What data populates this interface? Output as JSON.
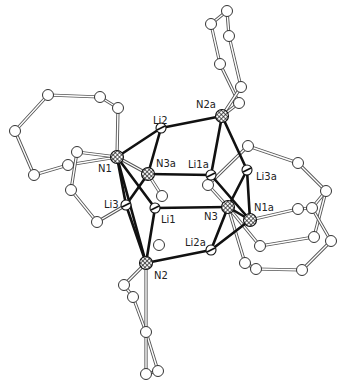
{
  "figure": {
    "type": "ORTEP-style molecular structure",
    "background": "#ffffff",
    "bond_color": "#111111",
    "ring_bond_color": "#555555"
  },
  "atoms": [
    {
      "id": "N1",
      "label": "N1",
      "kind": "N",
      "x": 117,
      "y": 157,
      "lx": 98,
      "ly": 172
    },
    {
      "id": "N2",
      "label": "N2",
      "kind": "N",
      "x": 146,
      "y": 263,
      "lx": 154,
      "ly": 279
    },
    {
      "id": "N3",
      "label": "N3",
      "kind": "N",
      "x": 228,
      "y": 207,
      "lx": 204,
      "ly": 220
    },
    {
      "id": "N1a",
      "label": "N1a",
      "kind": "N",
      "x": 250,
      "y": 220,
      "lx": 254,
      "ly": 211
    },
    {
      "id": "N2a",
      "label": "N2a",
      "kind": "N",
      "x": 222,
      "y": 116,
      "lx": 196,
      "ly": 108
    },
    {
      "id": "N3a",
      "label": "N3a",
      "kind": "N",
      "x": 148,
      "y": 174,
      "lx": 156,
      "ly": 167
    },
    {
      "id": "Li1",
      "label": "Li1",
      "kind": "Li",
      "x": 155,
      "y": 208,
      "lx": 161,
      "ly": 223
    },
    {
      "id": "Li2",
      "label": "Li2",
      "kind": "Li",
      "x": 161,
      "y": 128,
      "lx": 153,
      "ly": 124
    },
    {
      "id": "Li3",
      "label": "Li3",
      "kind": "Li",
      "x": 126,
      "y": 205,
      "lx": 104,
      "ly": 208
    },
    {
      "id": "Li1a",
      "label": "Li1a",
      "kind": "Li",
      "x": 211,
      "y": 175,
      "lx": 188,
      "ly": 168
    },
    {
      "id": "Li2a",
      "label": "Li2a",
      "kind": "Li",
      "x": 211,
      "y": 250,
      "lx": 185,
      "ly": 246
    },
    {
      "id": "Li3a",
      "label": "Li3a",
      "kind": "Li",
      "x": 247,
      "y": 170,
      "lx": 256,
      "ly": 180
    }
  ],
  "core_bonds": [
    [
      "N1",
      "Li2"
    ],
    [
      "N1",
      "Li3"
    ],
    [
      "N1",
      "Li1"
    ],
    [
      "N1",
      "N2"
    ],
    [
      "Li2",
      "N2a"
    ],
    [
      "Li2",
      "N3a"
    ],
    [
      "N3a",
      "Li1a"
    ],
    [
      "N3a",
      "Li3"
    ],
    [
      "Li1",
      "N3"
    ],
    [
      "Li1",
      "N2"
    ],
    [
      "Li3",
      "N2"
    ],
    [
      "N2",
      "Li2a"
    ],
    [
      "Li2a",
      "N3"
    ],
    [
      "Li2a",
      "N1a"
    ],
    [
      "N2a",
      "Li1a"
    ],
    [
      "N2a",
      "Li3a"
    ],
    [
      "Li1a",
      "N1a"
    ],
    [
      "N3",
      "Li3a"
    ],
    [
      "Li3a",
      "N1a"
    ],
    [
      "N3",
      "N1a"
    ]
  ],
  "carbons": [
    {
      "id": "c1",
      "x": 48,
      "y": 95
    },
    {
      "id": "c2",
      "x": 100,
      "y": 97
    },
    {
      "id": "c3",
      "x": 118,
      "y": 108
    },
    {
      "id": "c4",
      "x": 15,
      "y": 131
    },
    {
      "id": "c5",
      "x": 34,
      "y": 175
    },
    {
      "id": "c6",
      "x": 68,
      "y": 165
    },
    {
      "id": "c7",
      "x": 77,
      "y": 152
    },
    {
      "id": "c8",
      "x": 71,
      "y": 190
    },
    {
      "id": "c9",
      "x": 97,
      "y": 222
    },
    {
      "id": "c10",
      "x": 159,
      "y": 245
    },
    {
      "id": "c11",
      "x": 124,
      "y": 285
    },
    {
      "id": "c12",
      "x": 146,
      "y": 332
    },
    {
      "id": "c13",
      "x": 146,
      "y": 374
    },
    {
      "id": "c14",
      "x": 158,
      "y": 371
    },
    {
      "id": "c15",
      "x": 133,
      "y": 297
    },
    {
      "id": "c16",
      "x": 162,
      "y": 196
    },
    {
      "id": "c17",
      "x": 227,
      "y": 11
    },
    {
      "id": "c18",
      "x": 211,
      "y": 24
    },
    {
      "id": "c19",
      "x": 229,
      "y": 36
    },
    {
      "id": "c20",
      "x": 220,
      "y": 64
    },
    {
      "id": "c21",
      "x": 241,
      "y": 87
    },
    {
      "id": "c22",
      "x": 239,
      "y": 103
    },
    {
      "id": "c23",
      "x": 248,
      "y": 146
    },
    {
      "id": "c24",
      "x": 298,
      "y": 163
    },
    {
      "id": "c25",
      "x": 326,
      "y": 191
    },
    {
      "id": "c26",
      "x": 208,
      "y": 185
    },
    {
      "id": "c27",
      "x": 298,
      "y": 209
    },
    {
      "id": "c28",
      "x": 312,
      "y": 208
    },
    {
      "id": "c29",
      "x": 260,
      "y": 246
    },
    {
      "id": "c30",
      "x": 314,
      "y": 237
    },
    {
      "id": "c31",
      "x": 331,
      "y": 241
    },
    {
      "id": "c32",
      "x": 245,
      "y": 263
    },
    {
      "id": "c33",
      "x": 256,
      "y": 269
    },
    {
      "id": "c34",
      "x": 302,
      "y": 270
    }
  ],
  "ring_bonds": [
    [
      "c1",
      "c2"
    ],
    [
      "c2",
      "c3"
    ],
    [
      "c3",
      "N1"
    ],
    [
      "c1",
      "c4"
    ],
    [
      "c4",
      "c5"
    ],
    [
      "c5",
      "c6"
    ],
    [
      "c6",
      "N1"
    ],
    [
      "c7",
      "N1"
    ],
    [
      "c7",
      "c8"
    ],
    [
      "c8",
      "c9"
    ],
    [
      "c9",
      "Li3"
    ],
    [
      "c11",
      "N2"
    ],
    [
      "c11",
      "c15"
    ],
    [
      "c15",
      "c12"
    ],
    [
      "N2",
      "c12"
    ],
    [
      "c12",
      "c14"
    ],
    [
      "c13",
      "c14"
    ],
    [
      "c13",
      "c12"
    ],
    [
      "N3a",
      "c16"
    ],
    [
      "N1",
      "N3a"
    ],
    [
      "c17",
      "c18"
    ],
    [
      "c17",
      "c19"
    ],
    [
      "c18",
      "c20"
    ],
    [
      "c19",
      "c21"
    ],
    [
      "c20",
      "c22"
    ],
    [
      "c21",
      "N2a"
    ],
    [
      "c22",
      "N2a"
    ],
    [
      "c23",
      "c24"
    ],
    [
      "c24",
      "c25"
    ],
    [
      "c23",
      "c26"
    ],
    [
      "c26",
      "N3"
    ],
    [
      "N3",
      "c29"
    ],
    [
      "N1a",
      "c27"
    ],
    [
      "c27",
      "c28"
    ],
    [
      "c28",
      "c25"
    ],
    [
      "c25",
      "c30"
    ],
    [
      "c30",
      "c29"
    ],
    [
      "c28",
      "c31"
    ],
    [
      "c31",
      "c34"
    ],
    [
      "c34",
      "c33"
    ],
    [
      "c33",
      "c32"
    ],
    [
      "c32",
      "N3"
    ]
  ]
}
